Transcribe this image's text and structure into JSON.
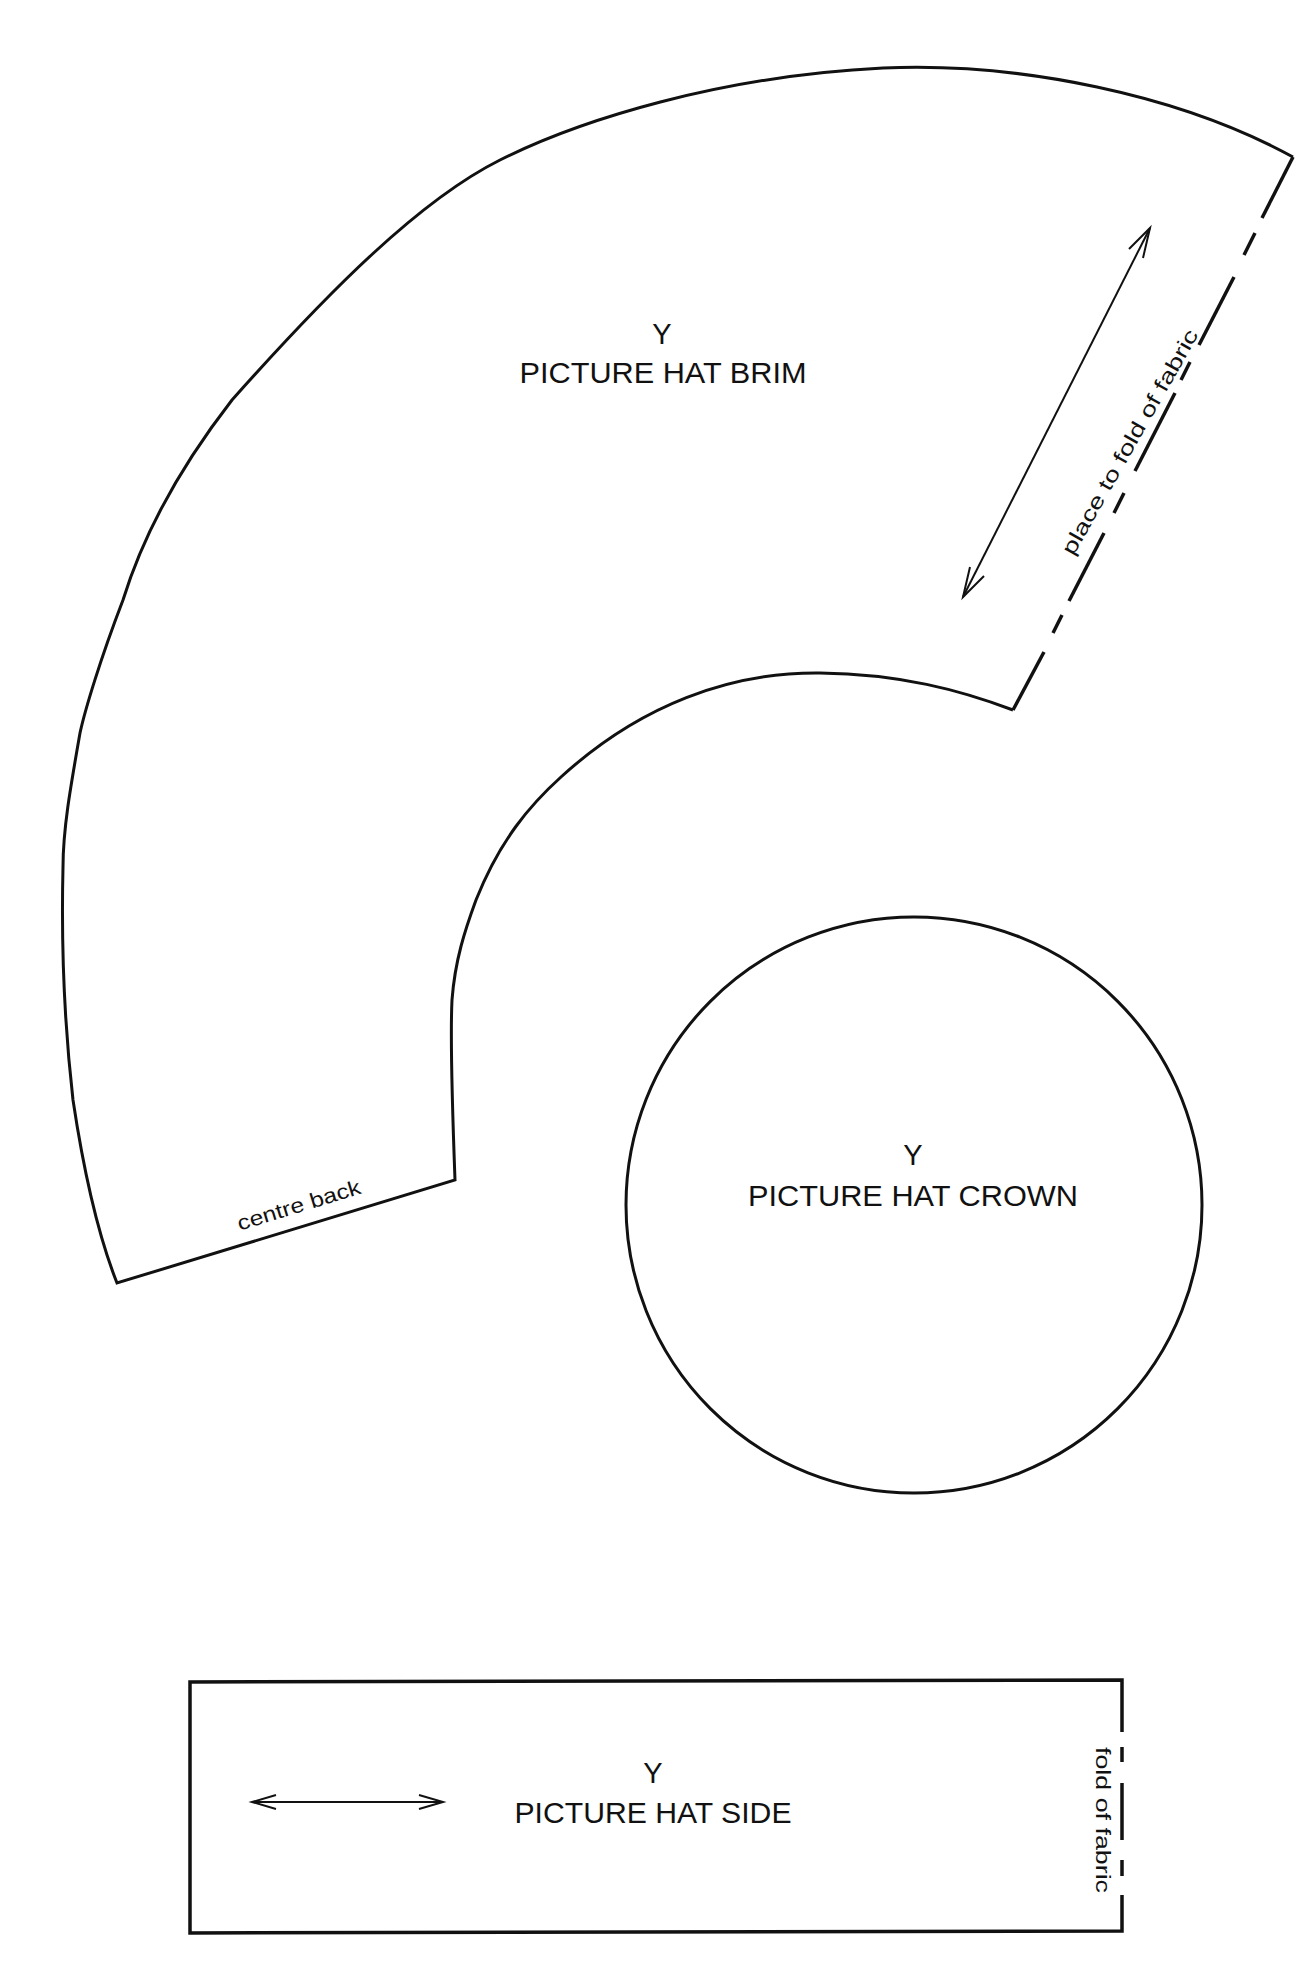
{
  "pattern": {
    "brim": {
      "letter": "Y",
      "title": "PICTURE HAT BRIM",
      "fold_note": "place to fold of fabric",
      "edge_note": "centre back"
    },
    "crown": {
      "letter": "Y",
      "title": "PICTURE HAT CROWN"
    },
    "side": {
      "letter": "Y",
      "title": "PICTURE HAT SIDE",
      "fold_note": "fold of fabric"
    }
  },
  "colors": {
    "line": "#111111",
    "background": "#ffffff"
  }
}
